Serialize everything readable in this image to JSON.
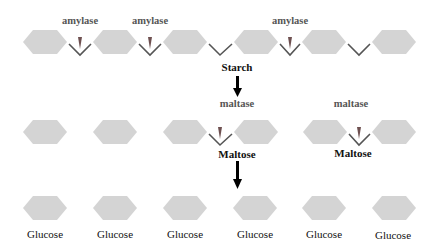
{
  "colors": {
    "hexagon": "#d4d4d4",
    "bond": "#555555",
    "cut_arrow": "#7a5a5a",
    "flow_arrow": "#000000",
    "enzyme_text": "#555555",
    "label_text": "#111111"
  },
  "rows": {
    "starch": {
      "hexagons": 6,
      "enzyme_labels": [
        {
          "text": "amylase",
          "x": 80
        },
        {
          "text": "amylase",
          "x": 150
        },
        {
          "text": "amylase",
          "x": 290
        }
      ],
      "label": "Starch"
    },
    "maltose": {
      "enzyme_labels": [
        {
          "text": "maltase",
          "x": 237
        },
        {
          "text": "maltase",
          "x": 351
        }
      ],
      "labels": [
        "Maltose",
        "Maltose"
      ]
    },
    "glucose": {
      "labels": [
        "Glucose",
        "Glucose",
        "Glucose",
        "Glucose",
        "Glucose",
        "Glucose"
      ]
    }
  }
}
